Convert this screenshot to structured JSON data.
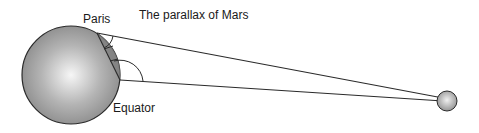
{
  "title": "The parallax of Mars",
  "labels": {
    "paris": "Paris",
    "equator": "Equator"
  },
  "colors": {
    "line": "#2a2a2a",
    "earth_light": "#f4f4f4",
    "earth_dark": "#8a8a8a",
    "mars_light": "#eeeeee",
    "mars_dark": "#8c8c8c"
  }
}
